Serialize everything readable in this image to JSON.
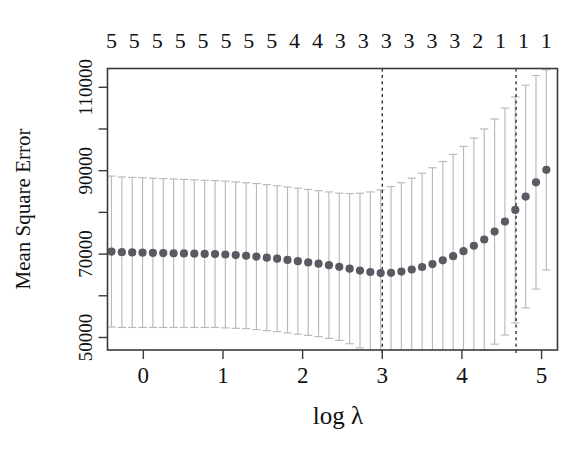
{
  "figure": {
    "kind": "cross-validation-curve",
    "background": "#ffffff",
    "point_color": "#5a5a62",
    "errorbar_color": "#b9b9b9",
    "axis_color": "#3a3a3a",
    "vline_color": "#1a1a1a"
  },
  "chart_data": {
    "type": "scatter",
    "title": "",
    "subtitle": "",
    "xlabel": "log λ",
    "ylabel": "Mean Square Error",
    "xlim": [
      -0.45,
      5.2
    ],
    "ylim": [
      47000,
      114500
    ],
    "grid": false,
    "legend": null,
    "xticks": [
      0,
      1,
      2,
      3,
      4,
      5
    ],
    "xticklabels": [
      "0",
      "1",
      "2",
      "3",
      "4",
      "5"
    ],
    "yticks": [
      50000,
      70000,
      90000,
      110000
    ],
    "yticklabels": [
      "50000",
      "70000",
      "90000",
      "110000"
    ],
    "yticks_minor": [
      60000,
      80000,
      100000
    ],
    "top_axis_label": "Number of nonzero coefficients",
    "top_axis_ticklabels": [
      "5",
      "5",
      "5",
      "5",
      "5",
      "5",
      "5",
      "5",
      "4",
      "4",
      "3",
      "3",
      "3",
      "3",
      "3",
      "3",
      "2",
      "1",
      "1",
      "1"
    ],
    "vlines": [
      {
        "x": 3.0,
        "label": "lambda.min",
        "style": "dashed"
      },
      {
        "x": 4.68,
        "label": "lambda.1se",
        "style": "dashed"
      }
    ],
    "x": [
      -0.4,
      -0.27,
      -0.14,
      -0.01,
      0.12,
      0.25,
      0.38,
      0.51,
      0.64,
      0.77,
      0.9,
      1.03,
      1.16,
      1.29,
      1.42,
      1.55,
      1.68,
      1.81,
      1.94,
      2.07,
      2.2,
      2.33,
      2.46,
      2.59,
      2.72,
      2.85,
      2.98,
      3.11,
      3.24,
      3.37,
      3.5,
      3.63,
      3.76,
      3.89,
      4.02,
      4.15,
      4.28,
      4.41,
      4.54,
      4.67,
      4.8,
      4.93,
      5.06
    ],
    "y": [
      70600,
      70450,
      70400,
      70350,
      70300,
      70250,
      70200,
      70150,
      70100,
      70050,
      70000,
      69900,
      69750,
      69600,
      69400,
      69150,
      68900,
      68600,
      68300,
      68000,
      67700,
      67350,
      66950,
      66500,
      66050,
      65700,
      65450,
      65500,
      65800,
      66300,
      66900,
      67600,
      68500,
      69500,
      70700,
      72000,
      73500,
      75400,
      77800,
      80600,
      83800,
      87200,
      90200
    ],
    "y_upper": [
      88700,
      88500,
      88400,
      88300,
      88200,
      88100,
      88000,
      87900,
      87800,
      87700,
      87600,
      87500,
      87300,
      87100,
      86900,
      86650,
      86400,
      86100,
      85800,
      85500,
      85200,
      84900,
      84600,
      84500,
      84600,
      84900,
      85400,
      86200,
      87100,
      88200,
      89400,
      90700,
      92200,
      93900,
      95800,
      97800,
      100000,
      102400,
      105000,
      107700,
      110500,
      112800,
      114200
    ],
    "y_lower": [
      52500,
      52400,
      52400,
      52400,
      52400,
      52400,
      52400,
      52400,
      52400,
      52400,
      52400,
      52300,
      52200,
      52100,
      51900,
      51650,
      51400,
      51100,
      50800,
      50500,
      50200,
      49800,
      49300,
      48500,
      47500,
      46500,
      45500,
      44800,
      44500,
      44400,
      44400,
      44500,
      44800,
      45100,
      45600,
      46200,
      47000,
      48400,
      50600,
      53500,
      57100,
      61600,
      66200
    ],
    "n_points": 43
  }
}
